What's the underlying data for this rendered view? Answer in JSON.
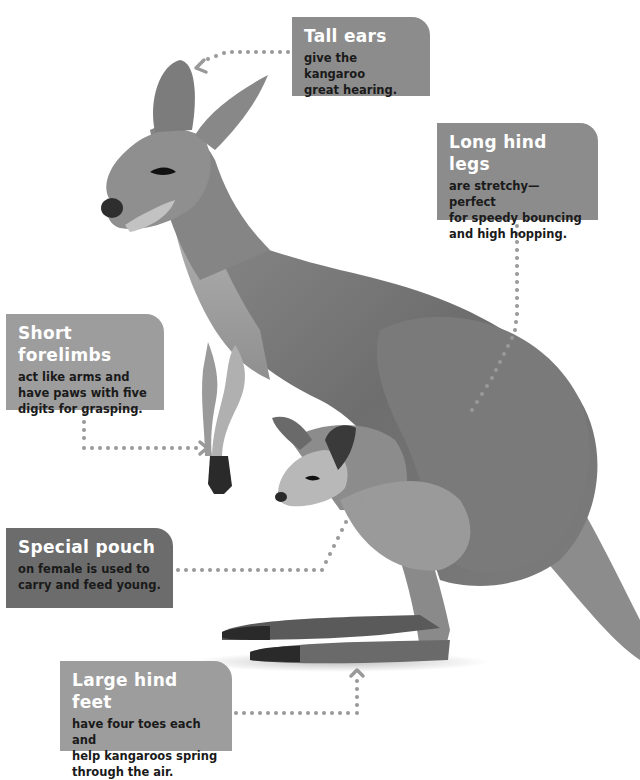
{
  "diagram": {
    "callouts": [
      {
        "id": "tall-ears",
        "title": "Tall ears",
        "desc": [
          "give the kangaroo",
          "great hearing."
        ]
      },
      {
        "id": "long-hind-legs",
        "title": "Long hind legs",
        "desc": [
          "are stretchy—perfect",
          "for speedy bouncing",
          "and high hopping."
        ]
      },
      {
        "id": "short-forelimbs",
        "title": "Short forelimbs",
        "desc": [
          "act like arms and",
          "have paws with five",
          "digits for grasping."
        ]
      },
      {
        "id": "special-pouch",
        "title": "Special pouch",
        "desc": [
          "on female is used to",
          "carry and feed young."
        ]
      },
      {
        "id": "large-hind-feet",
        "title": "Large hind feet",
        "desc": [
          "have four toes each and",
          "help kangaroos spring",
          "through the air."
        ]
      }
    ],
    "colors": {
      "callout_light": "#9d9d9d",
      "callout_mid": "#8c8c8c",
      "callout_dark": "#6c6c6c",
      "leader_dots": "#999999",
      "background": "#ffffff"
    }
  }
}
